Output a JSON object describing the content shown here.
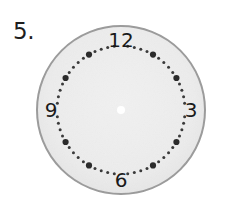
{
  "worksheet": {
    "problem_number": "5."
  },
  "clock": {
    "type": "analog-clock-face",
    "center": {
      "x": 121,
      "y": 110
    },
    "outer_radius": 85,
    "dial_radius": 64,
    "hub_radius": 4,
    "colors": {
      "face_fill": "#ececec",
      "face_stroke": "#9a9a9a",
      "hour_dot": "#2b2b2b",
      "minute_dot": "#3a3a3a",
      "numeral": "#1a1a1a",
      "hub": "#ffffff",
      "background": "#ffffff",
      "problem_number": "#1e1e1e"
    },
    "hands": [],
    "numerals": [
      {
        "label": "12",
        "hour": 12,
        "angle_deg": 0,
        "x": 121,
        "y": 40
      },
      {
        "label": "3",
        "hour": 3,
        "angle_deg": 90,
        "x": 191,
        "y": 110
      },
      {
        "label": "6",
        "hour": 6,
        "angle_deg": 180,
        "x": 121,
        "y": 180
      },
      {
        "label": "9",
        "hour": 9,
        "angle_deg": 270,
        "x": 51,
        "y": 110
      }
    ],
    "hour_marks": [
      {
        "hour": 12,
        "angle_deg": 0,
        "size": "large",
        "hidden": true
      },
      {
        "hour": 1,
        "angle_deg": 30,
        "size": "large",
        "hidden": false
      },
      {
        "hour": 2,
        "angle_deg": 60,
        "size": "large",
        "hidden": false
      },
      {
        "hour": 3,
        "angle_deg": 90,
        "size": "large",
        "hidden": true
      },
      {
        "hour": 4,
        "angle_deg": 120,
        "size": "large",
        "hidden": false
      },
      {
        "hour": 5,
        "angle_deg": 150,
        "size": "large",
        "hidden": false
      },
      {
        "hour": 6,
        "angle_deg": 180,
        "size": "large",
        "hidden": true
      },
      {
        "hour": 7,
        "angle_deg": 210,
        "size": "large",
        "hidden": false
      },
      {
        "hour": 8,
        "angle_deg": 240,
        "size": "large",
        "hidden": false
      },
      {
        "hour": 9,
        "angle_deg": 270,
        "size": "large",
        "hidden": true
      },
      {
        "hour": 10,
        "angle_deg": 300,
        "size": "large",
        "hidden": false
      },
      {
        "hour": 11,
        "angle_deg": 330,
        "size": "large",
        "hidden": false
      }
    ],
    "minute_marks_total": 60,
    "minute_dot_radius": 1.5,
    "hour_dot_radius": 3.1
  }
}
